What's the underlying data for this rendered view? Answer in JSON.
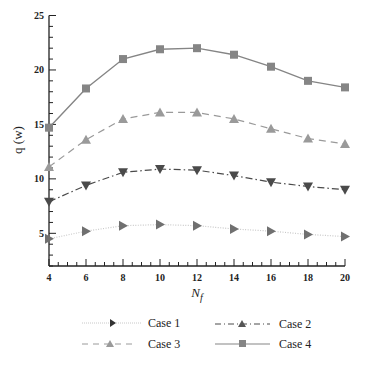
{
  "chart_data": {
    "type": "line",
    "title": "",
    "xlabel": "N_f",
    "xlabel_main": "N",
    "xlabel_sub": "f",
    "ylabel": "q (w)",
    "xlim": [
      4,
      20
    ],
    "ylim": [
      2,
      25
    ],
    "x_ticks": [
      4,
      6,
      8,
      10,
      12,
      14,
      16,
      18,
      20
    ],
    "y_ticks": [
      5,
      10,
      15,
      20,
      25
    ],
    "grid": false,
    "legend_position": "bottom",
    "x": [
      4,
      6,
      8,
      10,
      12,
      14,
      16,
      18,
      20
    ],
    "series": [
      {
        "name": "Case 1",
        "marker": "triangle-right",
        "line": "dotted",
        "color": "#c8c8c8",
        "marker_color": "#707070",
        "values": [
          4.5,
          5.2,
          5.7,
          5.8,
          5.7,
          5.4,
          5.2,
          4.9,
          4.7
        ]
      },
      {
        "name": "Case 2",
        "marker": "triangle-down",
        "line": "dash-dot",
        "color": "#4a4a4a",
        "marker_color": "#4a4a4a",
        "values": [
          7.9,
          9.4,
          10.6,
          10.9,
          10.8,
          10.3,
          9.7,
          9.3,
          9.0
        ]
      },
      {
        "name": "Case 3",
        "marker": "triangle-up",
        "line": "dashed",
        "color": "#9a9a9a",
        "marker_color": "#9a9a9a",
        "values": [
          11.1,
          13.6,
          15.5,
          16.1,
          16.1,
          15.5,
          14.6,
          13.7,
          13.2
        ]
      },
      {
        "name": "Case 4",
        "marker": "square",
        "line": "solid",
        "color": "#858585",
        "marker_color": "#858585",
        "values": [
          14.7,
          18.3,
          21.0,
          21.9,
          22.0,
          21.4,
          20.3,
          19.0,
          18.4
        ]
      }
    ]
  },
  "legend": {
    "items": [
      {
        "label": "Case 1"
      },
      {
        "label": "Case 2"
      },
      {
        "label": "Case 3"
      },
      {
        "label": "Case 4"
      }
    ]
  }
}
